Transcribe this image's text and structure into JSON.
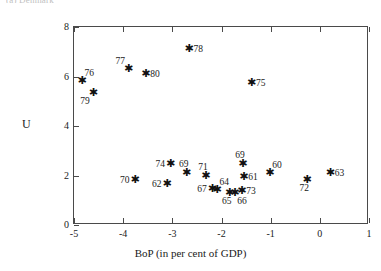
{
  "caption": "(a) Denmark",
  "chart_data": {
    "type": "scatter",
    "title": "",
    "xlabel": "BoP (in per cent of GDP)",
    "ylabel": "U",
    "xlim": [
      -5,
      1
    ],
    "ylim": [
      0,
      8
    ],
    "xticks": [
      "-5",
      "-4",
      "-3",
      "-2",
      "-1",
      "0",
      "1"
    ],
    "xtick_values": [
      -5,
      -4,
      -3,
      -2,
      -1,
      0,
      1
    ],
    "yticks": [
      "8",
      "6",
      "4",
      "2",
      "0"
    ],
    "ytick_values": [
      8,
      6,
      4,
      2,
      0
    ],
    "grid": false,
    "legend": "none",
    "marker": "asterisk",
    "marker_color": "#111111",
    "points": [
      {
        "label": "76",
        "x": -4.85,
        "y": 5.8,
        "lpos": "lab-tr"
      },
      {
        "label": "79",
        "x": -4.62,
        "y": 5.35,
        "lpos": "lab-bl"
      },
      {
        "label": "77",
        "x": -3.9,
        "y": 6.3,
        "lpos": "lab-tl"
      },
      {
        "label": "80",
        "x": -3.55,
        "y": 6.1,
        "lpos": "lab-r"
      },
      {
        "label": "78",
        "x": -2.67,
        "y": 7.1,
        "lpos": "lab-r"
      },
      {
        "label": "75",
        "x": -1.4,
        "y": 5.75,
        "lpos": "lab-r"
      },
      {
        "label": "70",
        "x": -3.77,
        "y": 1.8,
        "lpos": "lab-l"
      },
      {
        "label": "74",
        "x": -3.05,
        "y": 2.45,
        "lpos": "lab-l"
      },
      {
        "label": "62",
        "x": -3.12,
        "y": 1.65,
        "lpos": "lab-l"
      },
      {
        "label": "69",
        "x": -2.72,
        "y": 2.1,
        "lpos": "lab-t"
      },
      {
        "label": "71",
        "x": -2.33,
        "y": 2.0,
        "lpos": "lab-t"
      },
      {
        "label": "67",
        "x": -2.2,
        "y": 1.45,
        "lpos": "lab-l"
      },
      {
        "label": "64",
        "x": -2.1,
        "y": 1.4,
        "lpos": "lab-tr"
      },
      {
        "label": "65",
        "x": -1.85,
        "y": 1.3,
        "lpos": "lab-b"
      },
      {
        "label": "66",
        "x": -1.74,
        "y": 1.3,
        "lpos": "lab-br"
      },
      {
        "label": "73",
        "x": -1.6,
        "y": 1.38,
        "lpos": "lab-r"
      },
      {
        "label": "61",
        "x": -1.56,
        "y": 1.95,
        "lpos": "lab-r"
      },
      {
        "label": "69",
        "x": -1.58,
        "y": 2.45,
        "lpos": "lab-t"
      },
      {
        "label": "60",
        "x": -1.03,
        "y": 2.1,
        "lpos": "lab-tr"
      },
      {
        "label": "72",
        "x": -0.27,
        "y": 1.8,
        "lpos": "lab-b"
      },
      {
        "label": "63",
        "x": 0.2,
        "y": 2.1,
        "lpos": "lab-r"
      }
    ]
  }
}
